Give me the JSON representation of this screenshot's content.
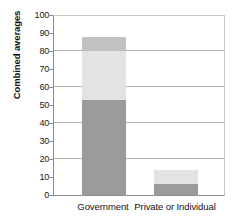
{
  "chart_data": {
    "type": "bar",
    "subtype": "stacked-bar",
    "title": "",
    "xlabel": "",
    "ylabel": "Combined averages",
    "categories": [
      "Government",
      "Private or Individual"
    ],
    "ylim": [
      0,
      100
    ],
    "y_ticks": [
      0,
      10,
      20,
      30,
      40,
      50,
      60,
      70,
      80,
      90,
      100
    ],
    "y_tick_labels": [
      "0",
      "10",
      "20",
      "30",
      "40",
      "50",
      "60",
      "70",
      "80",
      "90",
      "100"
    ],
    "gridlines_at": [
      20,
      40,
      60,
      80,
      100
    ],
    "grid": true,
    "legend": "none",
    "series": [
      {
        "name": "segment-bottom",
        "color": "#9b9b9b",
        "values": [
          53,
          6
        ]
      },
      {
        "name": "segment-middle",
        "color": "#e3e3e3",
        "values": [
          27,
          8
        ]
      },
      {
        "name": "segment-top",
        "color": "#c2c2c2",
        "values": [
          8,
          0
        ]
      }
    ],
    "totals": [
      88,
      14
    ]
  },
  "colors": {
    "segment_bottom": "#9b9b9b",
    "segment_middle": "#e3e3e3",
    "segment_top": "#c2c2c2",
    "gridline": "#b4b4b4",
    "axis": "#8c8c8c",
    "frame": "#c9c9c9",
    "text": "#141414",
    "background": "#ffffff"
  }
}
